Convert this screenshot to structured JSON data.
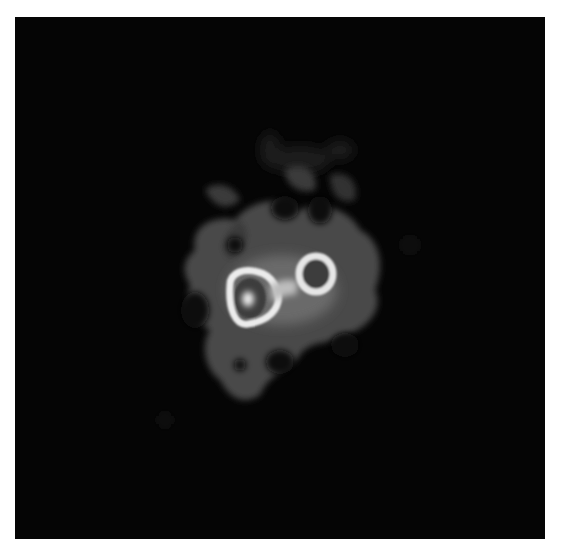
{
  "image": {
    "description": "Grayscale astronomical image of a diffuse nebulous blob with two bright ring-like sources near the center",
    "background_color": "#050505",
    "border_color": "#ffffff",
    "features": [
      {
        "name": "diffuse-halo",
        "cx": 280,
        "cy": 295,
        "color": "#5a5a5a"
      },
      {
        "name": "left-ring-source",
        "cx": 248,
        "cy": 298,
        "color": "#e8e8e8"
      },
      {
        "name": "left-core",
        "cx": 248,
        "cy": 298,
        "color": "#ffffff"
      },
      {
        "name": "right-ring-source",
        "cx": 316,
        "cy": 273,
        "color": "#e0e0e0"
      }
    ]
  }
}
